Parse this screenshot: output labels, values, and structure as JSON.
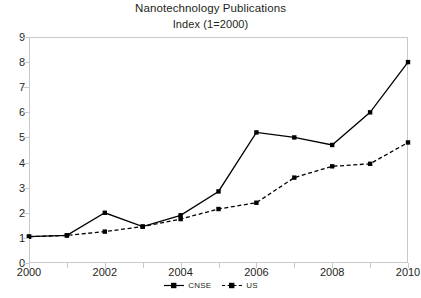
{
  "chart_data": {
    "type": "line",
    "title": "Nanotechnology Publications",
    "subtitle": "Index (1=2000)",
    "xlabel": "",
    "ylabel": "",
    "x": [
      2000,
      2001,
      2002,
      2003,
      2004,
      2005,
      2006,
      2007,
      2008,
      2009,
      2010
    ],
    "xtick_labels": [
      "2000",
      "",
      "2002",
      "",
      "2004",
      "",
      "2006",
      "",
      "2008",
      "",
      "2010"
    ],
    "xlim": [
      2000,
      2010
    ],
    "ylim": [
      0,
      9
    ],
    "ytick_labels": [
      "0",
      "1",
      "2",
      "3",
      "4",
      "5",
      "6",
      "7",
      "8",
      "9"
    ],
    "yticks": [
      0,
      1,
      2,
      3,
      4,
      5,
      6,
      7,
      8,
      9
    ],
    "grid": false,
    "legend_position": "bottom",
    "line_color": "#000000",
    "frame_color": "#c9c9c9",
    "series": [
      {
        "name": "CNSE",
        "style": "solid",
        "marker": "square",
        "values": [
          1.05,
          1.1,
          2.0,
          1.45,
          1.9,
          2.85,
          5.2,
          5.0,
          4.7,
          6.0,
          8.0
        ]
      },
      {
        "name": "US",
        "style": "dashed",
        "marker": "square",
        "values": [
          1.05,
          1.1,
          1.25,
          1.45,
          1.75,
          2.15,
          2.4,
          3.4,
          3.85,
          3.95,
          4.8
        ]
      }
    ]
  },
  "legend": {
    "items": [
      {
        "label": "CNSE"
      },
      {
        "label": "US"
      }
    ]
  }
}
